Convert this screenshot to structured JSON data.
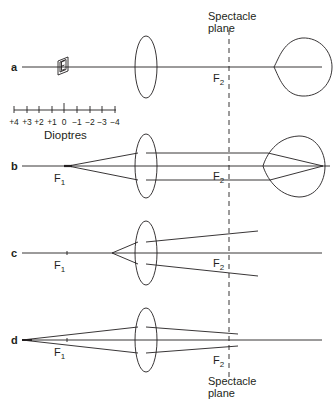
{
  "diagram": {
    "title": "Spectacle plane",
    "title_lines": [
      "Spectacle",
      "plane"
    ],
    "colors": {
      "ink": "#231f20",
      "background": "#ffffff"
    },
    "rows": [
      {
        "id": "a",
        "label": "a",
        "focal_labels": [
          {
            "main": "F",
            "sub": "2"
          }
        ],
        "has_eye": true,
        "object": "E-chart-target"
      },
      {
        "id": "b",
        "label": "b",
        "focal_labels": [
          {
            "main": "F",
            "sub": "1"
          },
          {
            "main": "F",
            "sub": "2"
          }
        ],
        "has_eye": true
      },
      {
        "id": "c",
        "label": "c",
        "focal_labels": [
          {
            "main": "F",
            "sub": "1"
          },
          {
            "main": "F",
            "sub": "2"
          }
        ],
        "has_eye": false
      },
      {
        "id": "d",
        "label": "d",
        "focal_labels": [
          {
            "main": "F",
            "sub": "1"
          },
          {
            "main": "F",
            "sub": "2"
          }
        ],
        "has_eye": false
      }
    ],
    "scale": {
      "ticks": [
        "+4",
        "+3",
        "+2",
        "+1",
        "0",
        "−1",
        "−2",
        "−3",
        "−4"
      ],
      "unit": "Dioptres"
    },
    "bottom_caption_lines": [
      "Spectacle",
      "plane"
    ]
  }
}
